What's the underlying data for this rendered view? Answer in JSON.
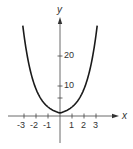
{
  "chart_data": {
    "type": "line",
    "title": "",
    "xlabel": "x",
    "ylabel": "y",
    "function": "y = 3^|x|",
    "xlim": [
      -4,
      5
    ],
    "ylim": [
      -9,
      35
    ],
    "x_ticks": [
      -3,
      -2,
      -1,
      1,
      2,
      3
    ],
    "x_tick_labels": [
      "-3",
      "-2",
      "-1",
      "1",
      "2",
      "3"
    ],
    "y_ticks": [
      6,
      10,
      20
    ],
    "y_tick_labels": [
      "10",
      "20"
    ],
    "grid": false,
    "legend": null,
    "series": [
      {
        "name": "curve",
        "x": [
          -3.1,
          -3,
          -2.5,
          -2,
          -1.5,
          -1,
          -0.5,
          0,
          0.5,
          1,
          1.5,
          2,
          2.5,
          3,
          3.1
        ],
        "values": [
          30.1,
          27,
          15.6,
          9,
          5.2,
          3,
          1.73,
          1,
          1.73,
          3,
          5.2,
          9,
          15.6,
          27,
          30.1
        ]
      }
    ],
    "color": "#1a1a1a"
  },
  "labels": {
    "x_axis": "x",
    "y_axis": "y",
    "x_ticks": [
      "-3",
      "-2",
      "-1",
      "1",
      "2",
      "3"
    ],
    "y_ticks": [
      "10",
      "20"
    ]
  }
}
